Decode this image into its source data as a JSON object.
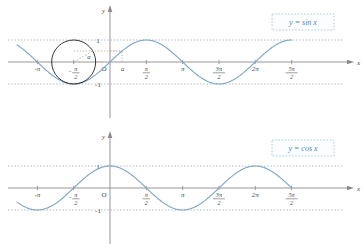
{
  "figure": {
    "background_color": "#ffffff",
    "curve_color": "#7fa8c9",
    "axis_color": "#8a8a8a",
    "grid_color": "#9aa6b2",
    "circle_color": "#2b2b2b",
    "legend_text_color": "#5b85a6"
  },
  "panels": [
    {
      "id": "sine-panel",
      "legend": "y = sin x",
      "y_axis_label": "y",
      "x_axis_label": "x",
      "origin_label": "O",
      "y_ticks": [
        "1",
        "-1"
      ],
      "x_ticks": [
        {
          "label": "-π",
          "num": "",
          "den": "",
          "value": -3.14159265
        },
        {
          "label": "",
          "num": "π",
          "den": "2",
          "sign": "-",
          "value": -1.57079633
        },
        {
          "label": "",
          "num": "π",
          "den": "2",
          "sign": "",
          "value": 1.57079633
        },
        {
          "label": "π",
          "num": "",
          "den": "",
          "value": 3.14159265
        },
        {
          "label": "",
          "num": "3π",
          "den": "2",
          "sign": "",
          "value": 4.71238898
        },
        {
          "label": "2π",
          "num": "",
          "den": "",
          "value": 6.28318531
        },
        {
          "label": "",
          "num": "5π",
          "den": "2",
          "sign": "",
          "value": 7.85398163
        }
      ],
      "annotations": {
        "angle_label": "α",
        "point_label": "a",
        "unit_circle_center_x": -1.57079633,
        "unit_circle_radius": 1,
        "alpha_value": 0.5235988
      }
    },
    {
      "id": "cosine-panel",
      "legend": "y = cos x",
      "y_axis_label": "y",
      "x_axis_label": "x",
      "origin_label": "O",
      "y_ticks": [
        "1",
        "-1"
      ],
      "x_ticks": [
        {
          "label": "-π",
          "num": "",
          "den": "",
          "value": -3.14159265
        },
        {
          "label": "",
          "num": "π",
          "den": "2",
          "sign": "-",
          "value": -1.57079633
        },
        {
          "label": "",
          "num": "π",
          "den": "2",
          "sign": "",
          "value": 1.57079633
        },
        {
          "label": "π",
          "num": "",
          "den": "",
          "value": 3.14159265
        },
        {
          "label": "",
          "num": "3π",
          "den": "2",
          "sign": "",
          "value": 4.71238898
        },
        {
          "label": "2π",
          "num": "",
          "den": "",
          "value": 6.28318531
        },
        {
          "label": "",
          "num": "5π",
          "den": "2",
          "sign": "",
          "value": 7.85398163
        }
      ],
      "annotations": {}
    }
  ],
  "chart_data": [
    {
      "type": "line",
      "title": "y = sin x",
      "xlabel": "x",
      "ylabel": "y",
      "xlim": [
        -3.6,
        8.4
      ],
      "ylim": [
        -1.35,
        1.35
      ],
      "grid": true,
      "legend_position": "top-right",
      "series": [
        {
          "name": "y = sin x",
          "function": "sin",
          "color": "#7fa8c9",
          "x": [
            -3.14159,
            -2.74889,
            -2.35619,
            -1.9635,
            -1.5708,
            -1.1781,
            -0.7854,
            -0.3927,
            0.0,
            0.3927,
            0.7854,
            1.1781,
            1.5708,
            1.9635,
            2.35619,
            2.74889,
            3.14159,
            3.53429,
            3.92699,
            4.31969,
            4.71239,
            5.10509,
            5.49779,
            5.89049,
            6.28319,
            6.67588,
            7.06858,
            7.46128,
            7.85398
          ],
          "y": [
            0.0,
            -0.38268,
            -0.70711,
            -0.92388,
            -1.0,
            -0.92388,
            -0.70711,
            -0.38268,
            0.0,
            0.38268,
            0.70711,
            0.92388,
            1.0,
            0.92388,
            0.70711,
            0.38268,
            0.0,
            -0.38268,
            -0.70711,
            -0.92388,
            -1.0,
            -0.92388,
            -0.70711,
            -0.38268,
            0.0,
            0.38268,
            0.70711,
            0.92388,
            1.0
          ]
        }
      ],
      "xticks": [
        -3.14159265,
        -1.57079633,
        1.57079633,
        3.14159265,
        4.71238898,
        6.28318531,
        7.85398163
      ],
      "xticklabels": [
        "-π",
        "-π/2",
        "π/2",
        "π",
        "3π/2",
        "2π",
        "5π/2"
      ],
      "yticks": [
        1,
        -1
      ],
      "yticklabels": [
        "1",
        "-1"
      ],
      "annotations": [
        {
          "type": "unit-circle",
          "center": [
            -1.57079633,
            0
          ],
          "radius": 1,
          "label": "α"
        },
        {
          "type": "point-marker",
          "x_label": "a",
          "x": 0.5235988,
          "y": 0.5
        }
      ]
    },
    {
      "type": "line",
      "title": "y = cos x",
      "xlabel": "x",
      "ylabel": "y",
      "xlim": [
        -3.6,
        8.4
      ],
      "ylim": [
        -1.35,
        1.35
      ],
      "grid": true,
      "legend_position": "top-right",
      "series": [
        {
          "name": "y = cos x",
          "function": "cos",
          "color": "#7fa8c9",
          "x": [
            -3.14159,
            -2.74889,
            -2.35619,
            -1.9635,
            -1.5708,
            -1.1781,
            -0.7854,
            -0.3927,
            0.0,
            0.3927,
            0.7854,
            1.1781,
            1.5708,
            1.9635,
            2.35619,
            2.74889,
            3.14159,
            3.53429,
            3.92699,
            4.31969,
            4.71239,
            5.10509,
            5.49779,
            5.89049,
            6.28319,
            6.67588,
            7.06858,
            7.46128,
            7.85398
          ],
          "y": [
            -1.0,
            -0.92388,
            -0.70711,
            -0.38268,
            0.0,
            0.38268,
            0.70711,
            0.92388,
            1.0,
            0.92388,
            0.70711,
            0.38268,
            0.0,
            -0.38268,
            -0.70711,
            -0.92388,
            -1.0,
            -0.92388,
            -0.70711,
            -0.38268,
            0.0,
            0.38268,
            0.70711,
            0.92388,
            1.0,
            0.92388,
            0.70711,
            0.38268,
            0.0
          ]
        }
      ],
      "xticks": [
        -3.14159265,
        -1.57079633,
        1.57079633,
        3.14159265,
        4.71238898,
        6.28318531,
        7.85398163
      ],
      "xticklabels": [
        "-π",
        "-π/2",
        "π/2",
        "π",
        "3π/2",
        "2π",
        "5π/2"
      ],
      "yticks": [
        1,
        -1
      ],
      "yticklabels": [
        "1",
        "-1"
      ],
      "annotations": []
    }
  ]
}
